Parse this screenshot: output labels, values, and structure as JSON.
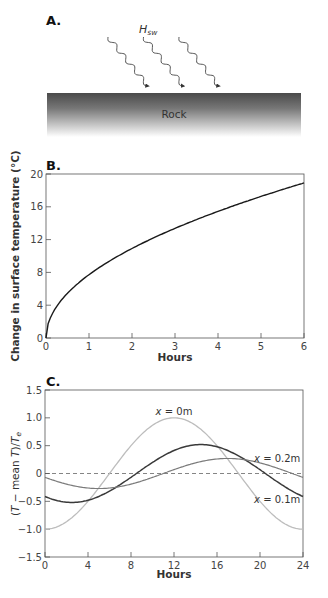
{
  "panels": {
    "a": {
      "label": "A.",
      "flux_label": "H",
      "flux_subscript": "sw",
      "rock_label": "Rock",
      "arrow_count": 3
    },
    "b": {
      "label": "B."
    },
    "c": {
      "label": "C."
    }
  },
  "colors": {
    "axis": "#555555",
    "curve_b": "#1a1a1a",
    "series_x0": "#bdbdbd",
    "series_x01": "#3a3a3a",
    "series_x02": "#7a7a7a",
    "rock_top": "#4a4a4a",
    "rock_bottom": "#ffffff"
  },
  "chart_data": [
    {
      "id": "B",
      "type": "line",
      "title": "",
      "xlabel": "Hours",
      "ylabel": "Change in surface temperature (°C)",
      "xlim": [
        0,
        6
      ],
      "ylim": [
        0,
        20
      ],
      "xticks": [
        0,
        1,
        2,
        3,
        4,
        5,
        6
      ],
      "yticks": [
        0,
        4,
        8,
        12,
        16,
        20
      ],
      "grid": false,
      "series": [
        {
          "name": "Surface temperature change",
          "x": [
            0,
            0.05,
            0.1,
            0.25,
            0.5,
            1,
            1.5,
            2,
            2.5,
            3,
            3.5,
            4,
            4.5,
            5,
            5.5,
            6
          ],
          "y": [
            0,
            1.7,
            2.4,
            3.9,
            5.4,
            7.7,
            9.4,
            10.9,
            12.2,
            13.3,
            14.4,
            15.4,
            16.3,
            17.2,
            18.1,
            18.9
          ]
        }
      ]
    },
    {
      "id": "C",
      "type": "line",
      "title": "",
      "xlabel": "Hours",
      "ylabel": "(T − mean T)/Te",
      "xlim": [
        0,
        24
      ],
      "ylim": [
        -1.5,
        1.5
      ],
      "xticks": [
        0,
        4,
        8,
        12,
        16,
        20,
        24
      ],
      "yticks": [
        -1.5,
        -1.0,
        -0.5,
        0,
        0.5,
        1.0,
        1.5
      ],
      "ytick_labels": [
        "−1.5",
        "−1.0",
        "−0.5",
        "0",
        "0.5",
        "1.0",
        "1.5"
      ],
      "reference_line": {
        "y": 0,
        "style": "dashed"
      },
      "grid": false,
      "series": [
        {
          "name": "x = 0m",
          "amplitude": 1.0,
          "peak_hour": 12,
          "x": [
            0,
            2,
            4,
            6,
            8,
            10,
            12,
            14,
            16,
            18,
            20,
            22,
            24
          ],
          "y": [
            -1.0,
            -0.87,
            -0.5,
            0.0,
            0.5,
            0.87,
            1.0,
            0.87,
            0.5,
            0.0,
            -0.5,
            -0.87,
            -1.0
          ]
        },
        {
          "name": "x = 0.1m",
          "amplitude": 0.52,
          "peak_hour": 14.5,
          "x": [
            0,
            2,
            4,
            6,
            8,
            10,
            12,
            14,
            16,
            18,
            20,
            22,
            24
          ],
          "y": [
            -0.41,
            -0.51,
            -0.47,
            -0.3,
            -0.06,
            0.2,
            0.41,
            0.52,
            0.48,
            0.31,
            0.07,
            -0.19,
            -0.41
          ]
        },
        {
          "name": "x = 0.2m",
          "amplitude": 0.27,
          "peak_hour": 17,
          "x": [
            0,
            2,
            4,
            6,
            8,
            10,
            12,
            14,
            16,
            18,
            20,
            22,
            24
          ],
          "y": [
            -0.07,
            -0.19,
            -0.26,
            -0.26,
            -0.19,
            -0.07,
            0.07,
            0.19,
            0.26,
            0.26,
            0.19,
            0.07,
            -0.07
          ]
        }
      ],
      "annotations": [
        {
          "text": "x = 0m",
          "x": 12,
          "y": 1.12
        },
        {
          "text": "x = 0.2m",
          "x": 21.6,
          "y": 0.27
        },
        {
          "text": "x = 0.1m",
          "x": 21.6,
          "y": -0.47
        }
      ]
    }
  ]
}
